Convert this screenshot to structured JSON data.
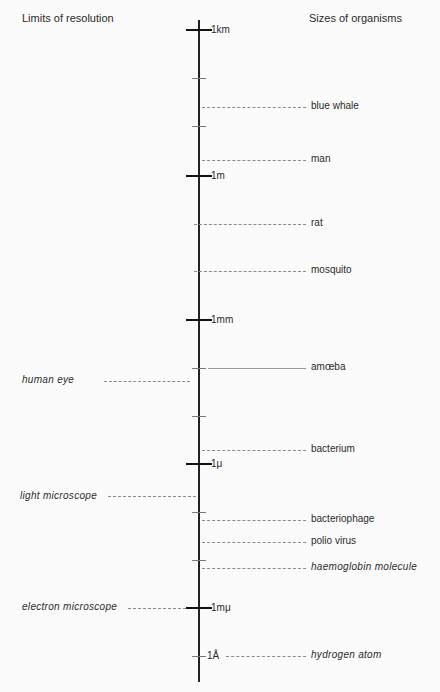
{
  "headers": {
    "left": "Limits of resolution",
    "right": "Sizes of organisms"
  },
  "scale": {
    "major_ticks": [
      {
        "label": "1km",
        "y": 30
      },
      {
        "label": "1m",
        "y": 176
      },
      {
        "label": "1mm",
        "y": 320
      },
      {
        "label": "1μ",
        "y": 464
      },
      {
        "label": "1mμ",
        "y": 608
      }
    ],
    "minor_ticks": [
      78,
      126,
      368,
      416,
      512,
      560
    ],
    "angstrom": {
      "label": "1Å",
      "y": 656
    }
  },
  "organisms": [
    {
      "label": "blue whale",
      "y": 107,
      "style": "dashed"
    },
    {
      "label": "man",
      "y": 160,
      "style": "dashed"
    },
    {
      "label": "rat",
      "y": 224,
      "style": "dashed"
    },
    {
      "label": "mosquito",
      "y": 271,
      "style": "dashed"
    },
    {
      "label": "amœba",
      "y": 368,
      "style": "solid"
    },
    {
      "label": "bacterium",
      "y": 450,
      "style": "dashed"
    },
    {
      "label": "bacteriophage",
      "y": 520,
      "style": "dashed"
    },
    {
      "label": "polio virus",
      "y": 542,
      "style": "dashed"
    },
    {
      "label": "haemoglobin molecule",
      "y": 568,
      "style": "dashed",
      "italic": true
    },
    {
      "label": "hydrogen atom",
      "y": 656,
      "style": "dashed",
      "italic": true
    }
  ],
  "resolution_limits": [
    {
      "label": "human eye",
      "y": 381
    },
    {
      "label": "light microscope",
      "y": 496
    },
    {
      "label": "electron microscope",
      "y": 608
    }
  ]
}
